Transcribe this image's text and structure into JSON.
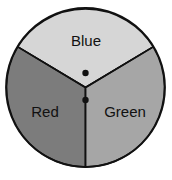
{
  "diagram": {
    "type": "spinner",
    "center": [
      85.5,
      87.5
    ],
    "radius": 79.5,
    "outline_color": "#111111",
    "sections": [
      {
        "label": "Blue",
        "fill": "#d6d6d6",
        "label_pos": [
          86,
          46
        ]
      },
      {
        "label": "Red",
        "fill": "#7c7c7c",
        "label_pos": [
          45,
          117
        ]
      },
      {
        "label": "Green",
        "fill": "#a6a6a6",
        "label_pos": [
          125,
          117
        ]
      }
    ],
    "dots": [
      {
        "x": 85.5,
        "y": 73,
        "r": 3
      },
      {
        "x": 85.5,
        "y": 100,
        "r": 3
      }
    ]
  }
}
